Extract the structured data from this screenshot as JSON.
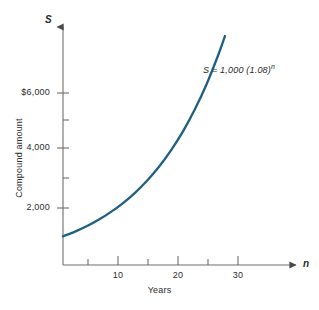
{
  "chart_data": {
    "type": "line",
    "title": "",
    "subtitle": "",
    "xlabel": "Years",
    "ylabel": "Compound amount",
    "x_axis_symbol": "n",
    "y_axis_symbol": "S",
    "annotation": "S = 1,000 (1.08)",
    "annotation_exponent": "n",
    "formula": "S = 1,000 (1.08)^n",
    "principal": 1000,
    "rate": 0.08,
    "grid": false,
    "legend": "none",
    "xlim": [
      0,
      34
    ],
    "ylim": [
      0,
      8000
    ],
    "x_ticks": [
      5,
      10,
      15,
      20,
      25,
      30
    ],
    "x_tick_labels": [
      "",
      "10",
      "",
      "20",
      "",
      "30"
    ],
    "y_ticks": [
      2000,
      3000,
      4000,
      5000,
      6000
    ],
    "y_tick_labels": [
      "2,000",
      "",
      "4,000",
      "",
      "$6,000"
    ],
    "line_color": "#1f5f82",
    "axis_color": "#6e6e6e",
    "x": [
      0,
      2,
      4,
      6,
      8,
      10,
      12,
      14,
      16,
      18,
      20,
      22,
      24,
      26,
      27
    ],
    "values": [
      1000,
      1166,
      1360,
      1587,
      1851,
      2159,
      2518,
      2937,
      3426,
      3996,
      4661,
      5437,
      6341,
      7396,
      7988
    ],
    "series": [
      {
        "name": "Compound amount",
        "values": [
          1000,
          1166,
          1360,
          1587,
          1851,
          2159,
          2518,
          2937,
          3426,
          3996,
          4661,
          5437,
          6341,
          7396,
          7988
        ]
      }
    ]
  },
  "figure": {
    "caption": ""
  }
}
